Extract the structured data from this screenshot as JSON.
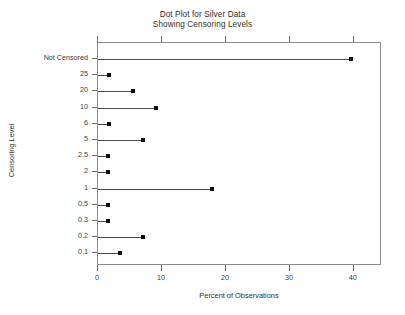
{
  "chart_data": {
    "type": "scatter",
    "title": "Dot Plot for Silver Data",
    "subtitle": "Showing Censoring Levels",
    "xlabel": "Percent of Observations",
    "ylabel": "Censoring Level",
    "xlim": [
      0,
      44.4
    ],
    "xticks": [
      0,
      10,
      20,
      30,
      40
    ],
    "xtick_labels": [
      "0",
      "10",
      "20",
      "30",
      "40"
    ],
    "categories": [
      "Not Censored",
      "25",
      "20",
      "10",
      "6",
      "5",
      "2.5",
      "2",
      "1",
      "0.5",
      "0.3",
      "0.2",
      "0.1"
    ],
    "values": [
      39.6,
      1.7,
      5.4,
      9.0,
      1.7,
      7.1,
      1.6,
      1.6,
      17.8,
      1.6,
      1.6,
      7.1,
      3.5
    ],
    "grid": false,
    "legend": "none",
    "marker": "square",
    "marker_color": "#0d0d0d",
    "line_color": "#4a4a4a",
    "frame_color": "#8c8c8c",
    "background": "#ffffff",
    "orientation": "horizontal"
  }
}
